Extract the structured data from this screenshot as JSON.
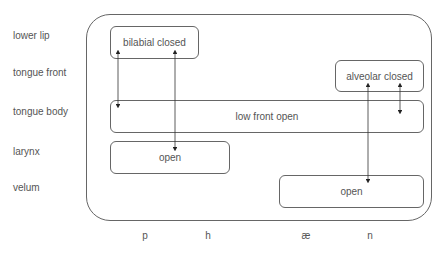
{
  "diagram": {
    "type": "articulatory-gesture-score",
    "tiers": [
      {
        "label": "lower lip"
      },
      {
        "label": "tongue front"
      },
      {
        "label": "tongue body"
      },
      {
        "label": "larynx"
      },
      {
        "label": "velum"
      }
    ],
    "segments": [
      {
        "label": "p"
      },
      {
        "label": "h"
      },
      {
        "label": "æ"
      },
      {
        "label": "n"
      }
    ],
    "gestures": [
      {
        "tier": "lower lip",
        "label": "bilabial closed"
      },
      {
        "tier": "tongue front",
        "label": "alveolar closed"
      },
      {
        "tier": "tongue body",
        "label": "low front open"
      },
      {
        "tier": "larynx",
        "label": "open"
      },
      {
        "tier": "velum",
        "label": "open"
      }
    ],
    "colors": {
      "stroke": "#666666",
      "text": "#555555",
      "background": "#ffffff"
    }
  }
}
